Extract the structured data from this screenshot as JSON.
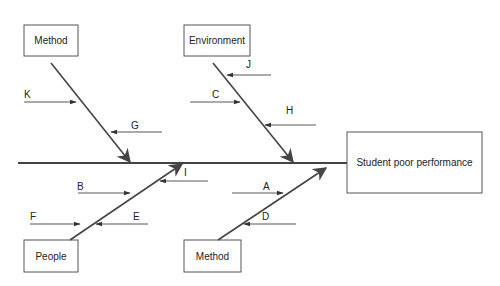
{
  "diagram": {
    "type": "fishbone",
    "effect": "Student poor performance",
    "categories": [
      {
        "id": "method_top",
        "label": "Method",
        "causes": [
          "K",
          "G"
        ]
      },
      {
        "id": "environment",
        "label": "Environment",
        "causes": [
          "J",
          "C",
          "H"
        ]
      },
      {
        "id": "people",
        "label": "People",
        "causes": [
          "B",
          "F",
          "E",
          "I"
        ]
      },
      {
        "id": "method_bottom",
        "label": "Method",
        "causes": [
          "A",
          "D"
        ]
      }
    ],
    "colors": {
      "line": "#444444",
      "box_border": "#555555",
      "text": "#222222"
    }
  }
}
